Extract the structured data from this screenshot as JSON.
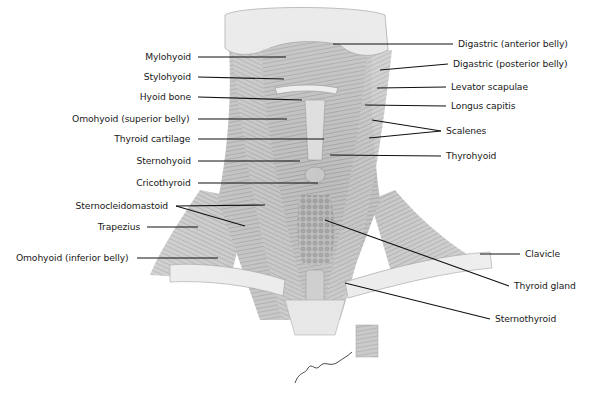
{
  "figure": {
    "signature": "John V. Hagen"
  },
  "labels_left": [
    {
      "id": "mylohyoid",
      "text": "Mylohyoid",
      "x": 198,
      "y": 57,
      "tx": 286,
      "ty": 57
    },
    {
      "id": "stylohyoid",
      "text": "Stylohyoid",
      "x": 198,
      "y": 77,
      "tx": 284,
      "ty": 79
    },
    {
      "id": "hyoid-bone",
      "text": "Hyoid bone",
      "x": 198,
      "y": 97,
      "tx": 302,
      "ty": 100
    },
    {
      "id": "omohyoid-superior",
      "text": "Omohyoid (superior belly)",
      "x": 198,
      "y": 119,
      "tx": 287,
      "ty": 119
    },
    {
      "id": "thyroid-cartilage",
      "text": "Thyroid cartilage",
      "x": 198,
      "y": 139,
      "tx": 324,
      "ty": 139
    },
    {
      "id": "sternohyoid",
      "text": "Sternohyoid",
      "x": 198,
      "y": 161,
      "tx": 300,
      "ty": 161
    },
    {
      "id": "cricothyroid",
      "text": "Cricothyroid",
      "x": 198,
      "y": 183,
      "tx": 318,
      "ty": 183
    },
    {
      "id": "sternocleidomastoid",
      "text": "Sternocleidomastoid",
      "x": 176,
      "y": 206,
      "tx": 265,
      "ty": 205,
      "tx2": 245,
      "ty2": 226
    },
    {
      "id": "trapezius",
      "text": "Trapezius",
      "x": 147,
      "y": 227,
      "tx": 198,
      "ty": 227
    },
    {
      "id": "omohyoid-inferior",
      "text": "Omohyoid (inferior belly)",
      "x": 137,
      "y": 258,
      "tx": 218,
      "ty": 258
    }
  ],
  "labels_right": [
    {
      "id": "digastric-anterior",
      "text": "Digastric (anterior belly)",
      "x": 453,
      "y": 44,
      "tx": 333,
      "ty": 44
    },
    {
      "id": "digastric-posterior",
      "text": "Digastric (posterior belly)",
      "x": 448,
      "y": 64,
      "tx": 380,
      "ty": 70
    },
    {
      "id": "levator-scapulae",
      "text": "Levator scapulae",
      "x": 446,
      "y": 87,
      "tx": 377,
      "ty": 88
    },
    {
      "id": "longus-capitis",
      "text": "Longus capitis",
      "x": 446,
      "y": 106,
      "tx": 365,
      "ty": 105
    },
    {
      "id": "scalenes",
      "text": "Scalenes",
      "x": 441,
      "y": 131,
      "tx": 372,
      "ty": 120,
      "tx2": 369,
      "ty2": 138
    },
    {
      "id": "thyrohyoid",
      "text": "Thyrohyoid",
      "x": 441,
      "y": 156,
      "tx": 330,
      "ty": 155
    },
    {
      "id": "clavicle",
      "text": "Clavicle",
      "x": 520,
      "y": 254,
      "tx": 480,
      "ty": 254
    },
    {
      "id": "thyroid-gland",
      "text": "Thyroid gland",
      "x": 509,
      "y": 286,
      "tx": 325,
      "ty": 220
    },
    {
      "id": "sternothyroid",
      "text": "Sternothyroid",
      "x": 490,
      "y": 319,
      "tx": 345,
      "ty": 283
    }
  ],
  "colors": {
    "text": "#1a1a1a",
    "leader": "#111111",
    "muscle_light": "#d9d9d9",
    "muscle_mid": "#a8a8a8",
    "muscle_dark": "#6e6e6e",
    "bone": "#ececec"
  }
}
